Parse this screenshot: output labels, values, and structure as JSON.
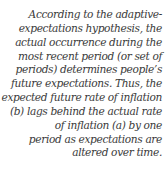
{
  "caption": {
    "lines": [
      "According to the adaptive-",
      "expectations hypothesis, the",
      "actual occurrence during the",
      "most recent period (or set of",
      "periods) determines people’s",
      "future expectations. Thus, the",
      "expected future rate of inflation",
      "(b) lags behind the actual rate",
      "of inflation (a) by one",
      "period as expectations are",
      "altered over time."
    ]
  }
}
